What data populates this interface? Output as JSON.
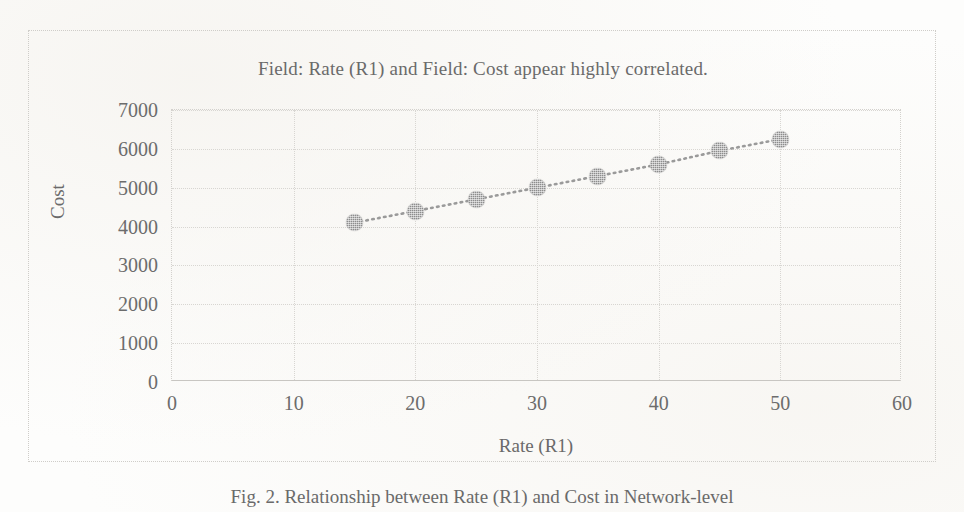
{
  "figure": {
    "caption": "Fig. 2.  Relationship between Rate (R1) and Cost in Network-level"
  },
  "chart_data": {
    "type": "scatter",
    "title": "Field: Rate (R1) and Field: Cost appear highly correlated.",
    "xlabel": "Rate (R1)",
    "ylabel": "Cost",
    "x": [
      15,
      20,
      25,
      30,
      35,
      40,
      45,
      50
    ],
    "values": [
      4100,
      4400,
      4700,
      5000,
      5300,
      5600,
      5950,
      6250
    ],
    "series": [
      {
        "name": "Cost vs Rate (R1)",
        "values": [
          4100,
          4400,
          4700,
          5000,
          5300,
          5600,
          5950,
          6250
        ]
      }
    ],
    "xlim": [
      0,
      60
    ],
    "ylim": [
      0,
      7000
    ],
    "xticks": [
      "0",
      "10",
      "20",
      "30",
      "40",
      "50",
      "60"
    ],
    "yticks": [
      "0",
      "1000",
      "2000",
      "3000",
      "4000",
      "5000",
      "6000",
      "7000"
    ],
    "xtick_values": [
      0,
      10,
      20,
      30,
      40,
      50,
      60
    ],
    "ytick_values": [
      0,
      1000,
      2000,
      3000,
      4000,
      5000,
      6000,
      7000
    ],
    "grid": true,
    "grid_style": "dotted",
    "legend": "none",
    "marker_shape": "circle",
    "marker_color": "#8d8d8d",
    "line_style": "dotted",
    "line_color": "#9a9a9a",
    "background_color": "#fdfdfc",
    "axis_color": "#c8c6c2"
  }
}
